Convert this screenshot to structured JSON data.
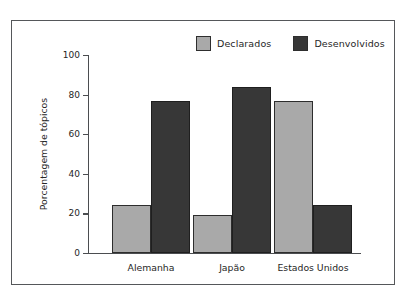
{
  "chart_data": {
    "type": "bar",
    "title": "",
    "xlabel": "",
    "ylabel": "Porcentagem de tópicos",
    "categories": [
      "Alemanha",
      "Japão",
      "Estados Unidos"
    ],
    "series": [
      {
        "name": "Declarados",
        "color": "#a9a9a9",
        "values": [
          24,
          19,
          77
        ]
      },
      {
        "name": "Desenvolvidos",
        "color": "#373737",
        "values": [
          77,
          84,
          24
        ]
      }
    ],
    "ylim": [
      0,
      100
    ],
    "yticks": [
      0,
      20,
      40,
      60,
      80,
      100
    ],
    "ytick_labels": [
      "0",
      "20",
      "40",
      "60",
      "80",
      "100"
    ],
    "grid": false,
    "legend_position": "top-right"
  },
  "legend": {
    "entries": [
      {
        "label": "Declarados",
        "swatch": "light-gray-swatch-icon"
      },
      {
        "label": "Desenvolvidos",
        "swatch": "dark-gray-swatch-icon"
      }
    ]
  },
  "colors": {
    "declarados": "#a9a9a9",
    "desenvolvidos": "#373737",
    "frame": "#55575a",
    "axis": "#4b4d50",
    "text": "#262626",
    "background": "#ffffff"
  }
}
